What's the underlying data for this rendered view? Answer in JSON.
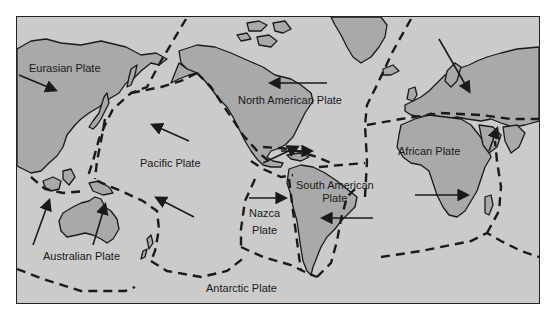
{
  "diagram": {
    "type": "tectonic-plate-map",
    "colors": {
      "ocean": "#cbcbcb",
      "land": "#a9a9a9",
      "line": "#1a1a1a",
      "page": "#ffffff"
    },
    "plates": [
      {
        "id": "eurasian",
        "label": "Eurasian Plate"
      },
      {
        "id": "north-american",
        "label": "North American Plate"
      },
      {
        "id": "pacific",
        "label": "Pacific Plate"
      },
      {
        "id": "african",
        "label": "African Plate"
      },
      {
        "id": "south-american",
        "label_line1": "South American",
        "label_line2": "Plate"
      },
      {
        "id": "nazca",
        "label_line1": "Nazca",
        "label_line2": "Plate"
      },
      {
        "id": "australian",
        "label": "Australian Plate"
      },
      {
        "id": "antarctic",
        "label": "Antarctic Plate"
      }
    ],
    "legend": {
      "dashed_line": "plate boundary",
      "arrow": "plate motion direction"
    }
  }
}
